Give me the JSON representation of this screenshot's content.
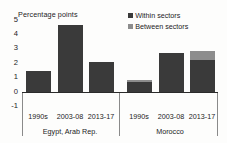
{
  "chart_data": {
    "type": "bar",
    "title": "",
    "subtitle": "",
    "xlabel": "",
    "ylabel": "Percentage points",
    "ylim": [
      -1,
      5
    ],
    "yticks": [
      5,
      4,
      3,
      2,
      1,
      0,
      -1
    ],
    "ytick_labels": [
      "5",
      "4",
      "3",
      "2",
      "1",
      "0",
      "-1"
    ],
    "grid": false,
    "stacked": true,
    "legend_position": "top-right",
    "legend": [
      "Within sectors",
      "Between sectors"
    ],
    "groups": [
      {
        "name": "Egypt, Arab Rep.",
        "categories": [
          "1990s",
          "2003-08",
          "2013-17"
        ]
      },
      {
        "name": "Morocco",
        "categories": [
          "1990s",
          "2003-08",
          "2013-17"
        ]
      }
    ],
    "categories": [
      "1990s",
      "2003-08",
      "2013-17",
      "1990s",
      "2003-08",
      "2013-17"
    ],
    "series": [
      {
        "name": "Within sectors",
        "color": "#3a3a3a",
        "values": [
          1.4,
          4.6,
          2.05,
          0.65,
          2.65,
          2.2
        ]
      },
      {
        "name": "Between sectors",
        "color": "#8d8d8d",
        "values": [
          0.0,
          0.0,
          0.0,
          0.15,
          0.0,
          0.6
        ]
      }
    ],
    "totals": [
      1.4,
      4.6,
      2.05,
      0.8,
      2.65,
      2.8
    ]
  },
  "colors": {
    "within": "#3a3a3a",
    "between": "#8d8d8d",
    "axis": "#2b2b2b",
    "separator": "#8a8a8a",
    "text": "#1c1c1c",
    "background": "#fdfdfc"
  }
}
